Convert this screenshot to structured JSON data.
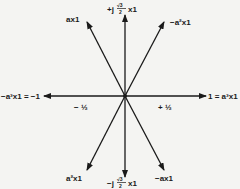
{
  "diagram": {
    "center": [
      125,
      96
    ],
    "stroke_color": "#1a1a1a",
    "background": "#f4f4f2",
    "vectors": [
      {
        "id": "a-x1",
        "label": "ax1",
        "tip": [
          87,
          22
        ]
      },
      {
        "id": "j-sqrt3-2",
        "label": "+j√3/2 x1",
        "tip": [
          125,
          15
        ]
      },
      {
        "id": "neg-a2-x1",
        "label": "−a²x1",
        "tip": [
          164,
          22
        ]
      },
      {
        "id": "one",
        "label": "1 = a³x1",
        "tip": [
          206,
          96
        ]
      },
      {
        "id": "neg-a-x1",
        "label": "−ax1",
        "tip": [
          164,
          170
        ]
      },
      {
        "id": "neg-j-sqrt3-2",
        "label": "−j√3/2 x1",
        "tip": [
          125,
          177
        ]
      },
      {
        "id": "a2-x1",
        "label": "a²x1",
        "tip": [
          87,
          170
        ]
      },
      {
        "id": "neg-one",
        "label": "−a³x1 = −1",
        "tip": [
          44,
          96
        ]
      }
    ],
    "labels": {
      "ax1": "ax1",
      "plus_j": "+j",
      "sqrt3": "√3",
      "two": "2",
      "x1": "x1",
      "neg_a2x1": "−a²x1",
      "one_eq": "1 = a³x1",
      "neg_ax1": "−ax1",
      "minus_j": "−j",
      "a2x1": "a²x1",
      "neg_one_eq": "−a³x1 = −1",
      "minus_half": "− ½",
      "plus_half": "+ ½"
    }
  }
}
